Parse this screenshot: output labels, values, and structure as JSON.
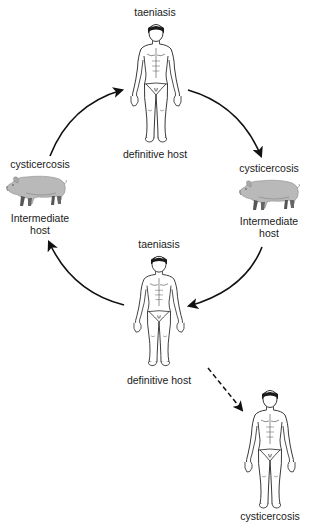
{
  "diagram": {
    "title": "",
    "type": "life-cycle",
    "colors": {
      "line": "#111111",
      "pig_fill": "#b9b9b9",
      "pig_dark": "#555555",
      "human_stroke": "#222222",
      "background": "#ffffff"
    },
    "nodes": [
      {
        "id": "top-human",
        "icon": "human-figure-icon",
        "top_label": "taeniasis",
        "bottom_label": "definitive host"
      },
      {
        "id": "left-pig",
        "icon": "pig-icon",
        "top_label": "cysticercosis",
        "bottom_label_line1": "Intermediate",
        "bottom_label_line2": "host"
      },
      {
        "id": "right-pig",
        "icon": "pig-icon",
        "top_label": "cysticercosis",
        "bottom_label_line1": "Intermediate",
        "bottom_label_line2": "host"
      },
      {
        "id": "middle-human",
        "icon": "human-figure-icon",
        "top_label": "taeniasis",
        "bottom_label": "definitive host"
      },
      {
        "id": "bottom-human",
        "icon": "human-figure-icon",
        "bottom_label": "cysticercosis"
      }
    ],
    "edges": [
      {
        "from": "left-pig",
        "to": "top-human",
        "style": "solid"
      },
      {
        "from": "top-human",
        "to": "right-pig",
        "style": "solid"
      },
      {
        "from": "right-pig",
        "to": "middle-human",
        "style": "solid"
      },
      {
        "from": "middle-human",
        "to": "left-pig",
        "style": "solid"
      },
      {
        "from": "middle-human",
        "to": "bottom-human",
        "style": "dashed"
      }
    ]
  }
}
